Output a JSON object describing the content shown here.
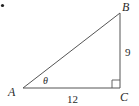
{
  "diagram": {
    "type": "right-triangle",
    "bullet": "•",
    "vertices": {
      "A": {
        "label": "A"
      },
      "B": {
        "label": "B"
      },
      "C": {
        "label": "C"
      }
    },
    "angle_label": "θ",
    "sides": {
      "AC": "12",
      "BC": "9"
    },
    "right_angle_at": "C",
    "colors": {
      "stroke": "#555555",
      "text": "#2a2a2a"
    }
  }
}
